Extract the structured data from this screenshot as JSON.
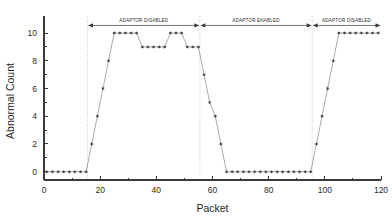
{
  "chart_data": {
    "type": "scatter",
    "title": "",
    "xlabel": "Packet",
    "ylabel": "Abnormal Count",
    "xlim": [
      0,
      120
    ],
    "ylim": [
      -0.6,
      10.8
    ],
    "xticks": [
      0,
      20,
      40,
      60,
      80,
      100,
      120
    ],
    "xticklabels": [
      "0",
      "20",
      "40",
      "60",
      "80",
      "100",
      "120"
    ],
    "yticks": [
      0,
      2,
      4,
      6,
      8,
      10
    ],
    "yticklabels": [
      "0",
      "2",
      "4",
      "6",
      "8",
      "10"
    ],
    "grid": false,
    "legend": null,
    "marker": "star",
    "series": [
      {
        "name": "Abnormal Count",
        "x": [
          1,
          3,
          5,
          7,
          9,
          11,
          13,
          15,
          17,
          19,
          21,
          23,
          25,
          27,
          29,
          31,
          33,
          35,
          37,
          39,
          41,
          43,
          45,
          47,
          49,
          51,
          53,
          55,
          57,
          59,
          61,
          63,
          65,
          67,
          69,
          71,
          73,
          75,
          77,
          79,
          81,
          83,
          85,
          87,
          89,
          91,
          93,
          95,
          97,
          99,
          101,
          103,
          105,
          107,
          109,
          111,
          113,
          115,
          117,
          119
        ],
        "y": [
          0,
          0,
          0,
          0,
          0,
          0,
          0,
          0,
          2,
          4,
          6,
          8,
          10,
          10,
          10,
          10,
          10,
          9,
          9,
          9,
          9,
          9,
          10,
          10,
          10,
          9,
          9,
          9,
          7,
          5,
          4,
          2,
          0,
          0,
          0,
          0,
          0,
          0,
          0,
          0,
          0,
          0,
          0,
          0,
          0,
          0,
          0,
          0,
          2,
          4,
          6,
          8,
          10,
          10,
          10,
          10,
          10,
          10,
          10,
          10
        ]
      }
    ],
    "separators": [
      {
        "x": 15.5,
        "style": "dotted"
      },
      {
        "x": 55.5,
        "style": "dotted"
      },
      {
        "x": 95.5,
        "style": "dotted"
      }
    ],
    "annotations": [
      {
        "label": "ADAPTOR DISABLED",
        "x_start": 15.5,
        "x_end": 55.5,
        "y": 10.55,
        "arrows": "both"
      },
      {
        "label": "ADAPTOR ENABLED",
        "x_start": 55.5,
        "x_end": 95.5,
        "y": 10.55,
        "arrows": "both"
      },
      {
        "label": "ADAPTOR DISABLED",
        "x_start": 95.5,
        "x_end": 120.0,
        "y": 10.55,
        "arrows": "both"
      }
    ],
    "colors": {
      "axis": "#3a3a3a",
      "marker": "#3b3b3b",
      "line": "#8d8d8d",
      "separator": "#b9b9b9",
      "background": "#ffffff"
    }
  }
}
